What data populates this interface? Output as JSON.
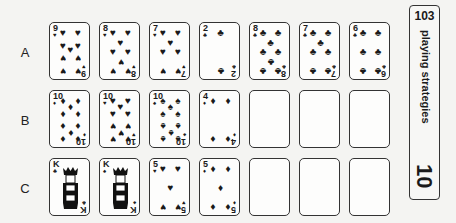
{
  "side_tab": {
    "number": "103",
    "title": "playing strategies",
    "page": "10"
  },
  "rows": [
    {
      "label": "A",
      "cards": [
        {
          "rank": "9",
          "suit": "♥",
          "suit_name": "hearts"
        },
        {
          "rank": "8",
          "suit": "♥",
          "suit_name": "hearts"
        },
        {
          "rank": "7",
          "suit": "♥",
          "suit_name": "hearts"
        },
        {
          "rank": "2",
          "suit": "♣",
          "suit_name": "clubs"
        },
        {
          "rank": "8",
          "suit": "♣",
          "suit_name": "clubs"
        },
        {
          "rank": "7",
          "suit": "♣",
          "suit_name": "clubs"
        },
        {
          "rank": "6",
          "suit": "♣",
          "suit_name": "clubs"
        }
      ]
    },
    {
      "label": "B",
      "cards": [
        {
          "rank": "10",
          "suit": "♦",
          "suit_name": "diamonds"
        },
        {
          "rank": "10",
          "suit": "♥",
          "suit_name": "hearts"
        },
        {
          "rank": "10",
          "suit": "♠",
          "suit_name": "spades"
        },
        {
          "rank": "4",
          "suit": "♦",
          "suit_name": "diamonds"
        },
        {
          "rank": "",
          "suit": "",
          "suit_name": "empty"
        },
        {
          "rank": "",
          "suit": "",
          "suit_name": "empty"
        },
        {
          "rank": "",
          "suit": "",
          "suit_name": "empty"
        }
      ]
    },
    {
      "label": "C",
      "cards": [
        {
          "rank": "K",
          "suit": "♣",
          "suit_name": "clubs"
        },
        {
          "rank": "K",
          "suit": "♠",
          "suit_name": "spades"
        },
        {
          "rank": "5",
          "suit": "♥",
          "suit_name": "hearts"
        },
        {
          "rank": "5",
          "suit": "♦",
          "suit_name": "diamonds"
        },
        {
          "rank": "",
          "suit": "",
          "suit_name": "empty"
        },
        {
          "rank": "",
          "suit": "",
          "suit_name": "empty"
        },
        {
          "rank": "",
          "suit": "",
          "suit_name": "empty"
        }
      ]
    }
  ]
}
